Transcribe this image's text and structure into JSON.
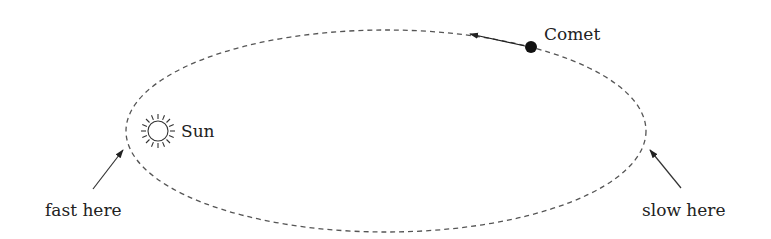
{
  "diagram": {
    "type": "orbit-diagram",
    "labels": {
      "comet": "Comet",
      "sun": "Sun",
      "fast": "fast here",
      "slow": "slow here"
    },
    "colors": {
      "orbit": "#555555",
      "ink": "#222222",
      "background": "#ffffff"
    },
    "icons": {
      "sun": "sun-icon",
      "comet": "comet-dot-icon"
    }
  }
}
